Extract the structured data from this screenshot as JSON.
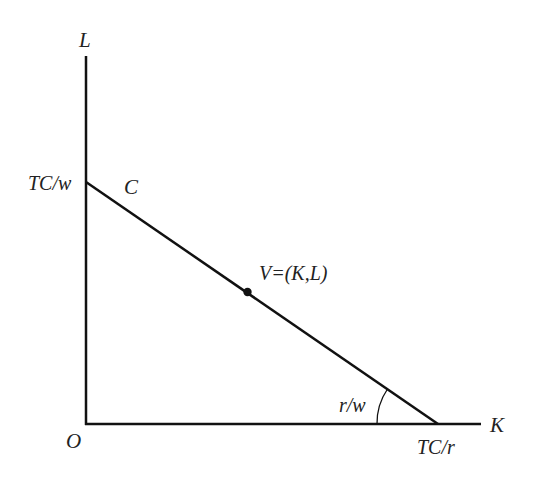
{
  "diagram": {
    "type": "isocost-line",
    "axes": {
      "y_label": "L",
      "x_label": "K",
      "origin_label": "O"
    },
    "line": {
      "name": "C",
      "y_intercept_label": "TC/w",
      "x_intercept_label": "TC/r",
      "slope_label": "r/w"
    },
    "point": {
      "label": "V=(K,L)"
    },
    "colors": {
      "stroke": "#111111",
      "text": "#222222",
      "background": "#ffffff"
    }
  }
}
